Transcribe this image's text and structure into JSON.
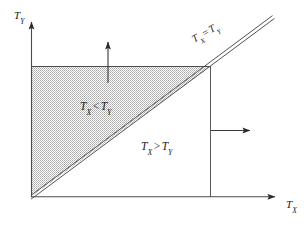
{
  "figure": {
    "background_color": "#ffffff",
    "line_color": "#3a3a3a",
    "stipple_color": "#8c8c8c"
  },
  "axes": {
    "y_label_main": "T",
    "y_label_sub": "Y",
    "x_label_main": "T",
    "x_label_sub": "X",
    "origin": {
      "x": 31,
      "y": 197
    },
    "x_axis_end": {
      "x": 282,
      "y": 197
    },
    "y_axis_end": {
      "x": 31,
      "y": 14
    }
  },
  "regions": {
    "upper": {
      "label_main_1": "T",
      "label_sub_1": "X",
      "operator": "<",
      "label_main_2": "T",
      "label_sub_2": "Y",
      "shaded": "true",
      "fill_pattern": "dotted-stipple"
    },
    "lower": {
      "label_main_1": "T",
      "label_sub_1": "X",
      "operator": ">",
      "label_main_2": "T",
      "label_sub_2": "Y",
      "shaded": "false",
      "fill_pattern": "none"
    }
  },
  "diagonal": {
    "label_main_1": "T",
    "label_sub_1": "X",
    "operator": "=",
    "label_main_2": "T",
    "label_sub_2": "Y",
    "rotation_degrees": "-29.5",
    "style": "double-line",
    "start": {
      "x": 31,
      "y": 196
    },
    "end": {
      "x": 273,
      "y": 17
    }
  },
  "annotations": {
    "up_arrow": {
      "name": "upward-direction-arrow",
      "from": {
        "x": 108,
        "y": 83
      },
      "to": {
        "x": 108,
        "y": 36
      }
    },
    "right_arrow": {
      "name": "rightward-direction-arrow",
      "from": {
        "x": 211,
        "y": 130
      },
      "to": {
        "x": 256,
        "y": 130
      }
    },
    "top_boundary": {
      "name": "horizontal-boundary-line",
      "from": {
        "x": 31,
        "y": 67
      },
      "to": {
        "x": 211,
        "y": 67
      }
    },
    "right_boundary": {
      "name": "vertical-boundary-line",
      "from": {
        "x": 211,
        "y": 67
      },
      "to": {
        "x": 211,
        "y": 197
      }
    }
  }
}
